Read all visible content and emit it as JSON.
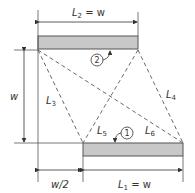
{
  "diagram": {
    "type": "view-factor geometry",
    "colors": {
      "surface_fill": "#c8c8c8",
      "line": "#333333"
    },
    "surfaces": [
      {
        "id": 1,
        "label": "1",
        "length_label": {
          "main": "L",
          "sub": "1",
          "rest": " = w"
        }
      },
      {
        "id": 2,
        "label": "2",
        "length_label": {
          "main": "L",
          "sub": "2",
          "rest": " = w"
        }
      }
    ],
    "dimensions": {
      "vertical": "w",
      "offset": "w/2"
    },
    "lines": [
      {
        "main": "L",
        "sub": "3"
      },
      {
        "main": "L",
        "sub": "4"
      },
      {
        "main": "L",
        "sub": "5"
      },
      {
        "main": "L",
        "sub": "6"
      }
    ]
  }
}
